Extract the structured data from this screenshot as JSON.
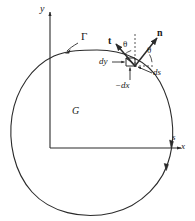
{
  "figure": {
    "kind": "math-diagram",
    "colors": {
      "stroke": "#2b2b2b",
      "background": "#ffffff",
      "text": "#1a1a1a"
    },
    "axes": {
      "y_label": "y",
      "x_label": "x",
      "origin_x": 50,
      "origin_y": 148
    },
    "labels": {
      "curve": "Γ",
      "region": "G",
      "arclength": "s",
      "tangent_vector": "t",
      "normal_vector": "n",
      "angle_1": "θ",
      "angle_2": "θ",
      "dy": "dy",
      "dx": "−dx",
      "ds": "ds"
    }
  }
}
